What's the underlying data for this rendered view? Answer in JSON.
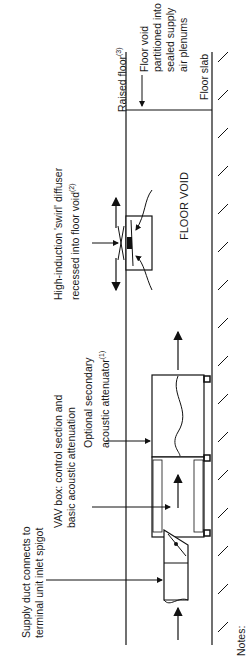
{
  "diagram": {
    "orientation": "rotated-90-ccw",
    "labels": {
      "supply_duct": [
        "Supply duct connects to",
        "terminal unit inlet spigot"
      ],
      "vav_box": [
        "VAV box: control section and",
        "basic acoustic attenuation"
      ],
      "attenuator": [
        "Optional secondary",
        "acoustic attenuator"
      ],
      "attenuator_note": "(1)",
      "diffuser": [
        "High-induction 'swirl' diffuser",
        "recessed into floor void"
      ],
      "diffuser_note": "(2)",
      "raised_floor": "Raised floor",
      "raised_floor_note": "(3)",
      "floor_void_partition": [
        "Floor void",
        "partitioned into",
        "sealed supply",
        "air plenums"
      ],
      "floor_slab": "Floor slab",
      "floor_void": "FLOOR VOID",
      "notes": "Notes:"
    },
    "colors": {
      "line": "#111111",
      "background": "#ffffff"
    }
  }
}
